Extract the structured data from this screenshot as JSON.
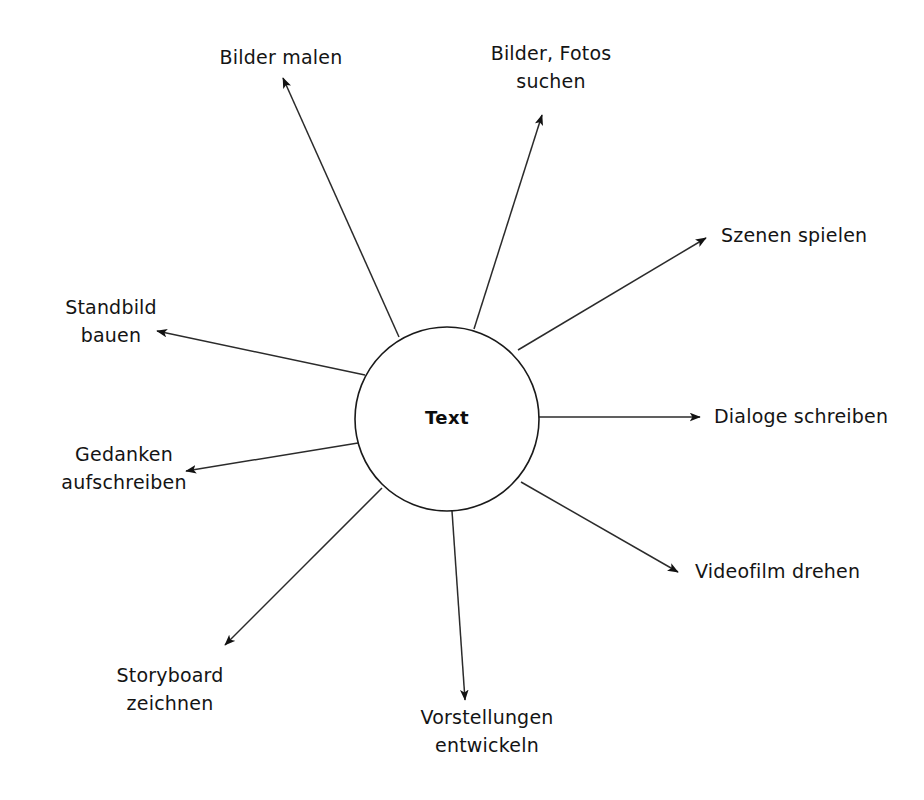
{
  "diagram": {
    "type": "radial-mindmap",
    "title_node": {
      "label": "Text",
      "shape": "circle",
      "center_x": 447,
      "center_y": 419,
      "radius": 92,
      "stroke": "#1a1a1a",
      "fill": "#ffffff"
    },
    "background_color": "#ffffff",
    "line_color": "#2b2b2b",
    "branches": [
      {
        "id": "bilder-malen",
        "lines": [
          "Bilder malen"
        ],
        "label_x": 281,
        "label_y": 44,
        "align": "center",
        "arrow_from_x": 399,
        "arrow_from_y": 337,
        "arrow_to_x": 283,
        "arrow_to_y": 78
      },
      {
        "id": "bilder-fotos-suchen",
        "lines": [
          "Bilder, Fotos",
          "suchen"
        ],
        "label_x": 551,
        "label_y": 40,
        "align": "center",
        "arrow_from_x": 474,
        "arrow_from_y": 329,
        "arrow_to_x": 542,
        "arrow_to_y": 115
      },
      {
        "id": "szenen-spielen",
        "lines": [
          "Szenen spielen"
        ],
        "label_x": 721,
        "label_y": 222,
        "align": "left",
        "arrow_from_x": 518,
        "arrow_from_y": 350,
        "arrow_to_x": 706,
        "arrow_to_y": 238
      },
      {
        "id": "dialoge-schreiben",
        "lines": [
          "Dialoge schreiben"
        ],
        "label_x": 714,
        "label_y": 403,
        "align": "left",
        "arrow_from_x": 539,
        "arrow_from_y": 417,
        "arrow_to_x": 700,
        "arrow_to_y": 417
      },
      {
        "id": "videofilm-drehen",
        "lines": [
          "Videofilm drehen"
        ],
        "label_x": 695,
        "label_y": 558,
        "align": "left",
        "arrow_from_x": 521,
        "arrow_from_y": 482,
        "arrow_to_x": 678,
        "arrow_to_y": 572
      },
      {
        "id": "vorstellungen-entwickeln",
        "lines": [
          "Vorstellungen",
          "entwickeln"
        ],
        "label_x": 487,
        "label_y": 704,
        "align": "center",
        "arrow_from_x": 452,
        "arrow_from_y": 511,
        "arrow_to_x": 465,
        "arrow_to_y": 700
      },
      {
        "id": "storyboard-zeichnen",
        "lines": [
          "Storyboard",
          "zeichnen"
        ],
        "label_x": 170,
        "label_y": 662,
        "align": "center",
        "arrow_from_x": 382,
        "arrow_from_y": 488,
        "arrow_to_x": 225,
        "arrow_to_y": 645
      },
      {
        "id": "gedanken-aufschreiben",
        "lines": [
          "Gedanken",
          "aufschreiben"
        ],
        "label_x": 124,
        "label_y": 441,
        "align": "center",
        "arrow_from_x": 358,
        "arrow_from_y": 443,
        "arrow_to_x": 186,
        "arrow_to_y": 471
      },
      {
        "id": "standbild-bauen",
        "lines": [
          "Standbild",
          "bauen"
        ],
        "label_x": 111,
        "label_y": 294,
        "align": "center",
        "arrow_from_x": 365,
        "arrow_from_y": 375,
        "arrow_to_x": 157,
        "arrow_to_y": 331
      }
    ]
  }
}
